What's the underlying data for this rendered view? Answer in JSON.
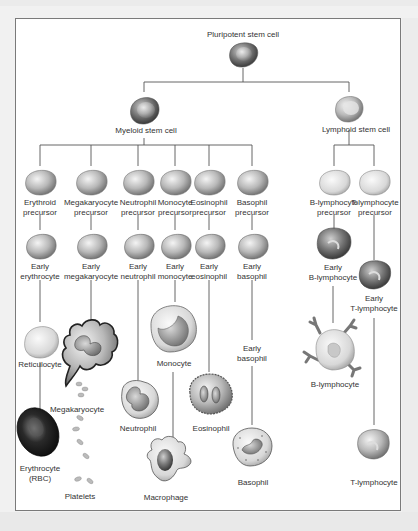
{
  "diagram": {
    "root": {
      "label": "Pluripotent stem cell"
    },
    "myeloid": {
      "label": "Myeloid stem cell"
    },
    "lymphoid": {
      "label": "Lymphoid stem cell"
    },
    "precursors": {
      "erythroid": [
        "Erythroid",
        "precursor"
      ],
      "megakaryocyte": [
        "Megakaryocyte",
        "precursor"
      ],
      "neutrophil": [
        "Neutrophil",
        "precursor"
      ],
      "monocyte": [
        "Monocyte",
        "precursor"
      ],
      "eosinophil": [
        "Eosinophil",
        "precursor"
      ],
      "basophil": [
        "Basophil",
        "precursor"
      ],
      "b_lymphocyte": [
        "B-lymphocyte",
        "precursor"
      ],
      "t_lymphocyte": [
        "T-lymphocyte",
        "precursor"
      ]
    },
    "early": {
      "erythrocyte": [
        "Early",
        "erythrocyte"
      ],
      "megakaryocyte": [
        "Early",
        "megakaryocyte"
      ],
      "neutrophil": [
        "Early",
        "neutrophil"
      ],
      "monocyte": [
        "Early",
        "monocyte"
      ],
      "eosinophil": [
        "Early",
        "eosinophil"
      ],
      "basophil": [
        "Early",
        "basophil"
      ],
      "basophil_2": [
        "Early",
        "basophil"
      ],
      "b_lymphocyte": [
        "Early",
        "B-lymphocyte"
      ],
      "t_lymphocyte": [
        "Early",
        "T-lymphocyte"
      ]
    },
    "mature": {
      "reticulocyte": "Reticulocyte",
      "erythrocyte": [
        "Erythrocyte",
        "(RBC)"
      ],
      "megakaryocyte": "Megakaryocyte",
      "platelets": "Platelets",
      "neutrophil": "Neutrophil",
      "monocyte": "Monocyte",
      "macrophage": "Macrophage",
      "eosinophil": "Eosinophil",
      "basophil": "Basophil",
      "b_lymphocyte": "B-lymphocyte",
      "t_lymphocyte": "T-lymphocyte"
    },
    "colors": {
      "line": "#555555",
      "cell_light": "#e6e6e6",
      "cell_mid": "#a8a8a8",
      "cell_dark": "#5a5a5a",
      "rbc": "#1a1a1a",
      "frame_border": "#7a7a7a"
    }
  }
}
